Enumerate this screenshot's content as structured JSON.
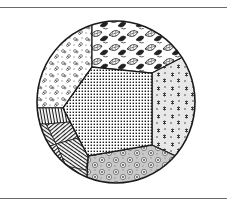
{
  "illustration": {
    "subject": "circular patchwork quilt block with pentagonal panels",
    "colors": {
      "ink": "#1a1a1a",
      "paper": "#ffffff",
      "rule": "#6a6a6a",
      "light_fill": "#e6e6e6",
      "mid_fill": "#bdbdbd"
    },
    "panels": [
      {
        "name": "center",
        "pattern": "dense-dots"
      },
      {
        "name": "top-left",
        "pattern": "scattered-flowers"
      },
      {
        "name": "top",
        "pattern": "leaves"
      },
      {
        "name": "right",
        "pattern": "sprigs-on-grey"
      },
      {
        "name": "bottom",
        "pattern": "rosettes-on-grey"
      },
      {
        "name": "left",
        "pattern": "woven-stripes"
      }
    ]
  }
}
